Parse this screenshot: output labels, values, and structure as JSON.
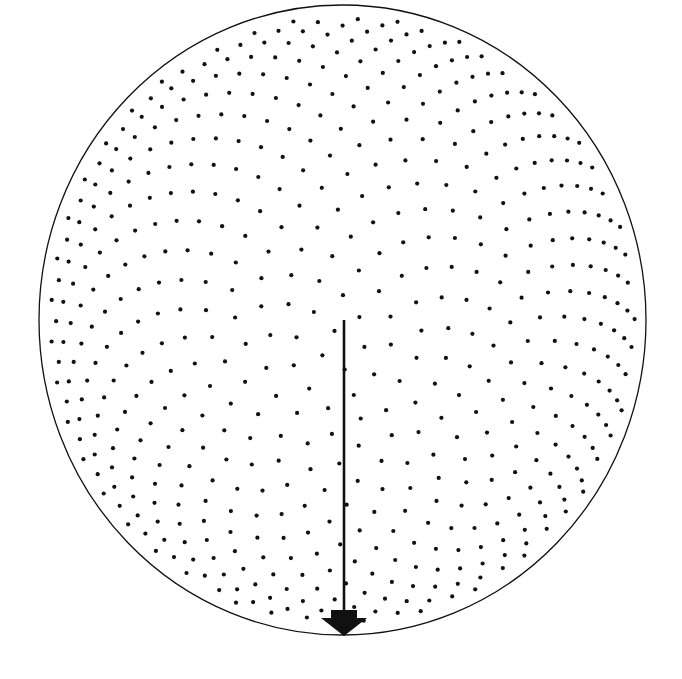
{
  "diagram": {
    "type": "projected-point-distribution",
    "background": "#ffffff",
    "ink": "#111111",
    "boundary": {
      "shape": "circle",
      "cx": 342.5,
      "cy": 320,
      "rx": 303.5,
      "ry": 315,
      "stroke_width": 1.3
    },
    "points": {
      "count": 1400,
      "distribution": "fibonacci-sphere",
      "projection": "orthographic",
      "tilt_deg": 14,
      "dense_center": {
        "x": 325,
        "y": 400
      },
      "dot_radius": 2.1,
      "hemisphere": "near"
    },
    "arrow": {
      "direction_icon": "arrow-down",
      "x": 344,
      "y_start": 320,
      "y_end": 636,
      "shaft_width": 2.6,
      "head_width": 46,
      "head_height": 18,
      "tail_step_width": 26,
      "tail_step_height": 8
    }
  }
}
